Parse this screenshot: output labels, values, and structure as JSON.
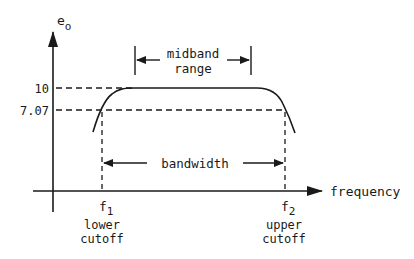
{
  "diagram": {
    "axes": {
      "y_label": "e",
      "y_label_sub": "o",
      "x_label": "frequency"
    },
    "y_ticks": [
      {
        "label": "10",
        "value": 10
      },
      {
        "label": "7.07",
        "value": 7.07
      }
    ],
    "cutoffs": {
      "lower": {
        "symbol": "f",
        "sub": "1",
        "line1": "lower",
        "line2": "cutoff"
      },
      "upper": {
        "symbol": "f",
        "sub": "2",
        "line1": "upper",
        "line2": "cutoff"
      }
    },
    "annotations": {
      "midband_line1": "midband",
      "midband_line2": "range",
      "bandwidth": "bandwidth"
    },
    "colors": {
      "ink": "#1a1a1a",
      "background": "#ffffff"
    }
  }
}
